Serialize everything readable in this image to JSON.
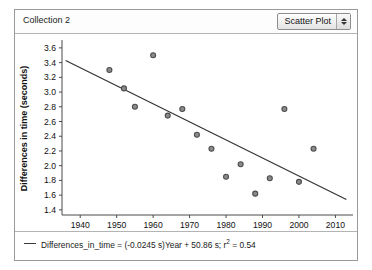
{
  "window": {
    "collection_title": "Collection 2"
  },
  "toolbar": {
    "plot_type_label": "Scatter Plot",
    "stepper_up_icon": "triangle-up-icon",
    "stepper_down_icon": "triangle-down-icon"
  },
  "legend": {
    "line_swatch_icon": "line-swatch-icon",
    "equation_text": "Differences_in_time = (-0.0245 s)Year + 50.86 s; r",
    "equation_exponent": "2",
    "equation_tail": " = 0.54"
  },
  "chart_data": {
    "type": "scatter",
    "title": "",
    "xlabel": "Year",
    "ylabel": "Differences in time (seconds)",
    "xlim": [
      1935,
      2014
    ],
    "ylim": [
      1.33,
      3.68
    ],
    "xticks": [
      1940,
      1950,
      1960,
      1970,
      1980,
      1990,
      2000,
      2010
    ],
    "xtick_labels": [
      "1940",
      "1950",
      "1960",
      "1970",
      "1980",
      "1990",
      "2000",
      "2010"
    ],
    "yticks": [
      1.4,
      1.6,
      1.8,
      2.0,
      2.2,
      2.4,
      2.6,
      2.8,
      3.0,
      3.2,
      3.4,
      3.6
    ],
    "ytick_labels": [
      "1.4",
      "1.6",
      "1.8",
      "2.0",
      "2.2",
      "2.4",
      "2.6",
      "2.8",
      "3.0",
      "3.2",
      "3.4",
      "3.6"
    ],
    "grid": false,
    "legend_position": "bottom-left",
    "marker_color": "#4d4d4d",
    "marker_fill": "#8a8a8a",
    "line_color": "#333333",
    "points": [
      {
        "x": 1948,
        "y": 3.3
      },
      {
        "x": 1952,
        "y": 3.05
      },
      {
        "x": 1955,
        "y": 2.8
      },
      {
        "x": 1960,
        "y": 3.5
      },
      {
        "x": 1964,
        "y": 2.68
      },
      {
        "x": 1968,
        "y": 2.77
      },
      {
        "x": 1972,
        "y": 2.42
      },
      {
        "x": 1976,
        "y": 2.23
      },
      {
        "x": 1980,
        "y": 1.85
      },
      {
        "x": 1984,
        "y": 2.02
      },
      {
        "x": 1988,
        "y": 1.62
      },
      {
        "x": 1992,
        "y": 1.83
      },
      {
        "x": 1996,
        "y": 2.77
      },
      {
        "x": 2000,
        "y": 1.78
      },
      {
        "x": 2004,
        "y": 2.23
      }
    ],
    "fit_line": {
      "slope": -0.0245,
      "intercept": 50.86,
      "r_squared": 0.54,
      "x_start": 1936,
      "x_end": 2013
    }
  }
}
